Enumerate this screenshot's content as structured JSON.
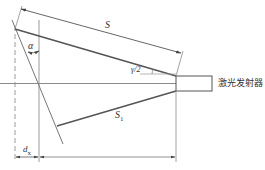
{
  "diagram": {
    "labels": {
      "distance_s": "S",
      "distance_s1_main": "S",
      "distance_s1_sub": "1",
      "angle_alpha": "α",
      "half_angle": "γ/2",
      "offset_d_main": "d",
      "offset_d_sub": "x",
      "emitter": "激光发射器"
    },
    "colors": {
      "line": "#555555",
      "thin_line": "#8a8a8a",
      "text": "#333333"
    }
  }
}
